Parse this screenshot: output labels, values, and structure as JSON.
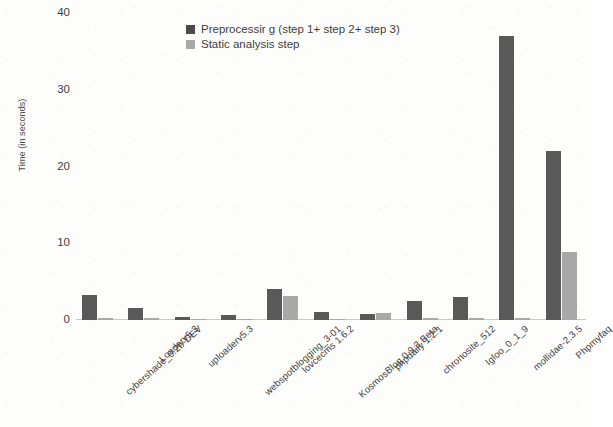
{
  "chart_data": {
    "type": "bar",
    "title": "",
    "subtitle": "",
    "xlabel": "",
    "ylabel": "Time (in seconds)",
    "ylim": [
      0,
      40
    ],
    "yticks": [
      0,
      10,
      20,
      30,
      40
    ],
    "ytick_labels": [
      "0",
      "10",
      "20",
      "30",
      "40"
    ],
    "grid": false,
    "legend_position": "top-center",
    "categories": [
      "cybershade_0.2b-DEV",
      "Loaderv5.3",
      "uploaderv5.3",
      "webspotblogging_3-01",
      "lovcecms 1.6.2",
      "KosmosBlog 0.9.3 Beta",
      "phpdaily 1.2.1",
      "chronosite_512",
      "Igloo_0_1_9",
      "mollidae-2.3.5",
      "Phpmyfaq"
    ],
    "series": [
      {
        "name": "Preprocessir g (step 1+ step 2+ step 3)",
        "color": "#595959",
        "values": [
          3.3,
          1.6,
          0.4,
          0.6,
          4.1,
          1.1,
          0.8,
          2.5,
          3.0,
          37.0,
          22.0
        ]
      },
      {
        "name": "Static analysis step",
        "color": "#a8a8a8",
        "values": [
          0.3,
          0.2,
          0.1,
          0.15,
          3.1,
          0.15,
          0.9,
          0.2,
          0.2,
          0.2,
          8.9
        ]
      }
    ]
  },
  "legend": {
    "items": [
      {
        "label": "Preprocessir g (step 1+ step 2+ step 3)",
        "swatch": "dark"
      },
      {
        "label": "Static analysis step",
        "swatch": "light"
      }
    ]
  },
  "axis": {
    "y_title": "Time (in seconds)",
    "y_ticks": [
      "40",
      "30",
      "20",
      "10",
      "0"
    ]
  }
}
